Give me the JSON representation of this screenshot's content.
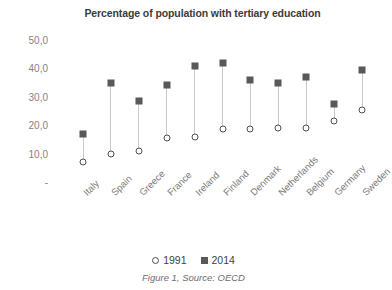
{
  "chart_data": {
    "type": "scatter",
    "title": "Percentage of population with tertiary education",
    "caption": "Figure 1, Source: OECD",
    "xlabel": "",
    "ylabel": "",
    "ylim": [
      0,
      50
    ],
    "yticks": [
      "-",
      "10,0",
      "20,0",
      "30,0",
      "40,0",
      "50,0"
    ],
    "ytick_values": [
      0,
      10,
      20,
      30,
      40,
      50
    ],
    "grid": false,
    "legend_position": "bottom",
    "categories": [
      "Italy",
      "Spain",
      "Greece",
      "France",
      "Ireland",
      "Finland",
      "Denmark",
      "Netherlands",
      "Belgium",
      "Germany",
      "Sweden"
    ],
    "series": [
      {
        "name": "1991",
        "marker": "open-circle",
        "color": "#4d4d4d",
        "values": [
          7.0,
          10.0,
          11.0,
          15.5,
          16.0,
          18.5,
          18.5,
          19.0,
          19.0,
          21.5,
          25.5
        ]
      },
      {
        "name": "2014",
        "marker": "filled-square",
        "color": "#595959",
        "values": [
          17.0,
          35.0,
          28.5,
          34.0,
          41.0,
          42.0,
          36.0,
          35.0,
          37.0,
          27.5,
          39.5
        ]
      }
    ]
  }
}
